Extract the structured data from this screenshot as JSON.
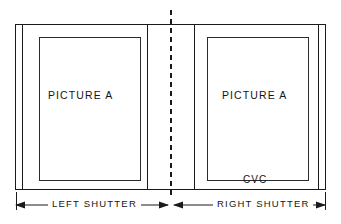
{
  "figure": {
    "type": "technical-line-drawing",
    "background_color": "#ffffff",
    "line_color": "#1a1a1a",
    "width": 341,
    "height": 224
  },
  "panels": {
    "left": {
      "picture_label": "PICTURE A",
      "dimension_label": "LEFT SHUTTER"
    },
    "right": {
      "picture_label": "PICTURE A",
      "dimension_label": "RIGHT SHUTTER",
      "annotation": "CVC"
    }
  },
  "center": {
    "centerline_style": "dashed"
  },
  "icons": {
    "arrow_left": "arrow-left-icon",
    "arrow_right": "arrow-right-icon",
    "centerline": "centerline-dashed-icon"
  }
}
